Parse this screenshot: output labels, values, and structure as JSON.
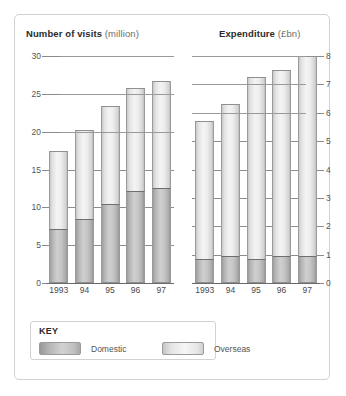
{
  "key_panel": {
    "title": "KEY",
    "entries": [
      {
        "label": "Domestic",
        "color": "#b4b4b4"
      },
      {
        "label": "Overseas",
        "color": "#ededed"
      }
    ]
  },
  "chart_data": [
    {
      "type": "bar",
      "id": "number-of-visits",
      "title": "Number of visits",
      "unit": "(million)",
      "xlabel": "",
      "ylabel": "million",
      "categories": [
        "1993",
        "94",
        "95",
        "96",
        "97"
      ],
      "ylim": [
        0,
        30
      ],
      "yticks": [
        0,
        5,
        10,
        15,
        20,
        25,
        30
      ],
      "ytick_labels": [
        "0",
        "5",
        "10",
        "15",
        "20",
        "25",
        "30"
      ],
      "axis_side": "left",
      "grid": true,
      "stacked": true,
      "legend": "below",
      "series": [
        {
          "name": "Domestic",
          "values": [
            7.1,
            8.5,
            10.5,
            12.2,
            12.6
          ],
          "color": "#b4b4b4"
        },
        {
          "name": "Overseas",
          "values": [
            10.3,
            11.7,
            12.9,
            13.6,
            14.1
          ],
          "color": "#ededed"
        }
      ],
      "totals": [
        17.4,
        20.2,
        23.4,
        25.8,
        26.7
      ]
    },
    {
      "type": "bar",
      "id": "expenditure",
      "title": "Expenditure",
      "unit": "(£bn)",
      "xlabel": "",
      "ylabel": "£bn",
      "categories": [
        "1993",
        "94",
        "95",
        "96",
        "97"
      ],
      "ylim": [
        0,
        8
      ],
      "yticks": [
        0,
        1,
        2,
        3,
        4,
        5,
        6,
        7,
        8
      ],
      "ytick_labels": [
        "0",
        "1",
        "2",
        "3",
        "4",
        "5",
        "6",
        "7",
        "8"
      ],
      "axis_side": "right",
      "grid": true,
      "stacked": true,
      "legend": "below",
      "series": [
        {
          "name": "Domestic",
          "values": [
            0.85,
            0.95,
            0.85,
            0.95,
            0.95
          ],
          "color": "#b4b4b4"
        },
        {
          "name": "Overseas",
          "values": [
            4.85,
            5.35,
            6.4,
            6.55,
            7.05
          ],
          "color": "#ededed"
        }
      ],
      "totals": [
        5.7,
        6.3,
        7.25,
        7.5,
        8.0
      ]
    }
  ]
}
